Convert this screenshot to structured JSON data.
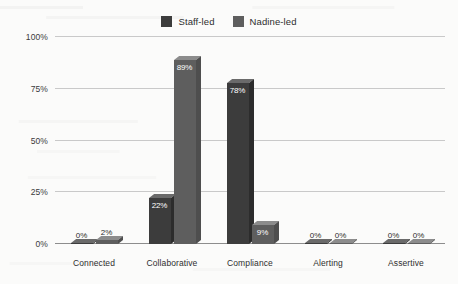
{
  "chart_data": {
    "type": "bar",
    "title": "",
    "subtitle": "",
    "xlabel": "",
    "ylabel": "",
    "categories": [
      "Connected",
      "Collaborative",
      "Compliance",
      "Alerting",
      "Assertive"
    ],
    "series": [
      {
        "name": "Staff-led",
        "color": "#3c3c3c",
        "values": [
          0,
          22,
          78,
          0,
          0
        ],
        "labels": [
          "0%",
          "22%",
          "78%",
          "0%",
          "0%"
        ]
      },
      {
        "name": "Nadine-led",
        "color": "#5e5e5e",
        "values": [
          2,
          89,
          9,
          0,
          0
        ],
        "labels": [
          "2%",
          "89%",
          "9%",
          "0%",
          "0%"
        ]
      }
    ],
    "ylim": [
      0,
      100
    ],
    "yticks": [
      0,
      25,
      50,
      75,
      100
    ],
    "ytick_labels": [
      "0%",
      "25%",
      "50%",
      "75%",
      "100%"
    ],
    "grid": true,
    "legend_position": "top-center",
    "style": "3d-bar"
  },
  "legend": {
    "entries": [
      {
        "label": "Staff-led",
        "color": "#3c3c3c"
      },
      {
        "label": "Nadine-led",
        "color": "#5e5e5e"
      }
    ]
  },
  "axis": {
    "y_labels": [
      "100%",
      "75%",
      "50%",
      "25%",
      "0%"
    ],
    "x_labels": [
      "Connected",
      "Collaborative",
      "Compliance",
      "Alerting",
      "Assertive"
    ]
  }
}
